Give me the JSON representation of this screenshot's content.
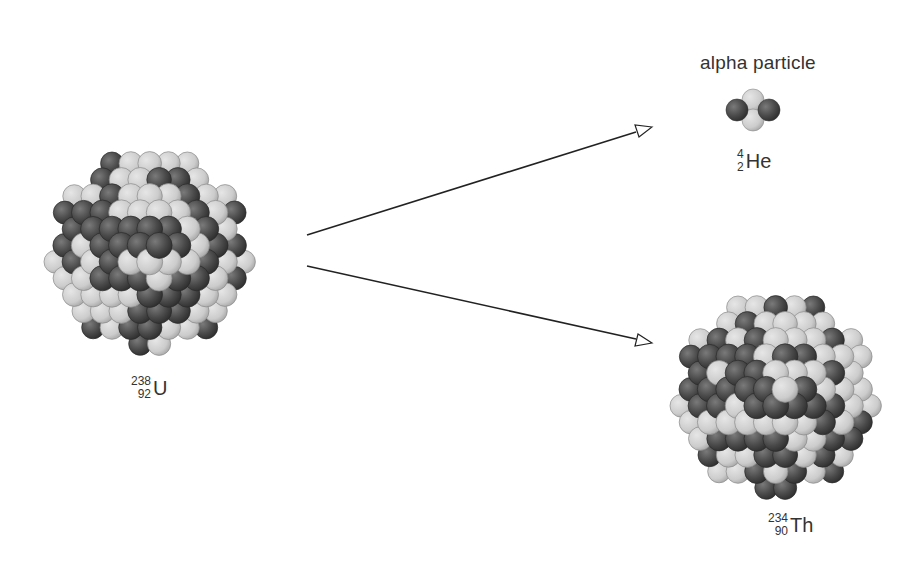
{
  "diagram": {
    "type": "alpha-decay",
    "parent": {
      "symbol": "U",
      "mass_number": "238",
      "atomic_number": "92"
    },
    "daughter": {
      "symbol": "Th",
      "mass_number": "234",
      "atomic_number": "90"
    },
    "emitted": {
      "title": "alpha particle",
      "symbol": "He",
      "mass_number": "4",
      "atomic_number": "2"
    },
    "colors": {
      "proton": "#4a4a4a",
      "neutron": "#c9c9c9",
      "arrow": "#222222"
    }
  }
}
